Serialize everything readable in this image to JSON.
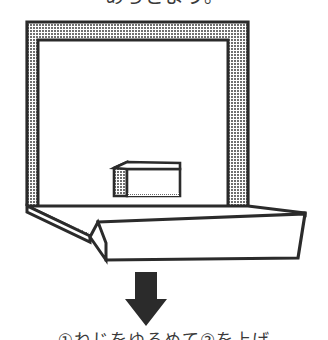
{
  "page": {
    "width": 328,
    "height": 340,
    "background_color": "#ffffff",
    "kind": "scanned-line-art-diagram"
  },
  "captions": {
    "top": {
      "text": "あらどよう。",
      "note": "clipped — only bottom sliver of glyphs visible",
      "color": "#3a3a3a"
    },
    "bottom": {
      "text": "①ねじをゆるめて②を上げ",
      "note": "clipped — only top sliver of glyphs visible",
      "color": "#3a3a3a"
    }
  },
  "figure": {
    "name": "frame-on-base-perspective-drawing",
    "colors": {
      "outline": "#2b2b2b",
      "halftone_gray": "#8f8f8f",
      "fill_white": "#ffffff",
      "arrow_fill": "#2b2b2b"
    },
    "parts": [
      {
        "name": "upright-frame",
        "label": "Rectangular upright frame with shaded inner band",
        "bounds": {
          "x": 27,
          "y": 22,
          "width": 221,
          "height": 184
        }
      },
      {
        "name": "base-platform",
        "label": "Angled base platform seen in perspective",
        "bounds": {
          "x": 90,
          "y": 198,
          "width": 215,
          "height": 62
        }
      },
      {
        "name": "small-box",
        "label": "Small shaded box resting at the frame base",
        "bounds": {
          "x": 113,
          "y": 162,
          "width": 67,
          "height": 34
        }
      },
      {
        "name": "down-arrow",
        "label": "Solid black arrow pointing downward",
        "bounds": {
          "x": 128,
          "y": 272,
          "width": 36,
          "height": 54
        }
      }
    ]
  }
}
